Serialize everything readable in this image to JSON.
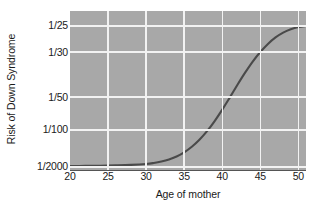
{
  "chart_data": {
    "type": "line",
    "title": "",
    "xlabel": "Age of mother",
    "ylabel": "Risk of Down Syndrome",
    "xlim": [
      20,
      51
    ],
    "grid": true,
    "legend": null,
    "xticks": [
      {
        "label": "20",
        "value": 20
      },
      {
        "label": "25",
        "value": 25
      },
      {
        "label": "30",
        "value": 30
      },
      {
        "label": "35",
        "value": 35
      },
      {
        "label": "40",
        "value": 40
      },
      {
        "label": "45",
        "value": 45
      },
      {
        "label": "50",
        "value": 50
      }
    ],
    "yticks": [
      {
        "label": "1/25",
        "value": 0.04,
        "pixel_frac": 0.094
      },
      {
        "label": "1/30",
        "value": 0.0333,
        "pixel_frac": 0.258
      },
      {
        "label": "1/50",
        "value": 0.02,
        "pixel_frac": 0.541
      },
      {
        "label": "1/100",
        "value": 0.01,
        "pixel_frac": 0.748
      },
      {
        "label": "1/2000",
        "value": 0.0005,
        "pixel_frac": 0.981
      }
    ],
    "series": [
      {
        "name": "Risk of Down Syndrome",
        "color": "#4a4a4a",
        "x": [
          20,
          22,
          24,
          26,
          28,
          30,
          31,
          32,
          33,
          34,
          35,
          36,
          37,
          38,
          39,
          40,
          41,
          42,
          43,
          44,
          45,
          46,
          47,
          48,
          49,
          50,
          51
        ],
        "y_labels": [
          "1/1800",
          "1/1790",
          "1/1770",
          "1/1740",
          "1/1700",
          "1/1640",
          "1/1580",
          "1/1500",
          "1/1380",
          "1/1230",
          "1/1050",
          "1/860",
          "1/690",
          "1/520",
          "1/380",
          "1/270",
          "1/190",
          "1/140",
          "1/100",
          "1/75",
          "1/58",
          "1/47",
          "1/39",
          "1/33",
          "1/29",
          "1/26",
          "1/25"
        ],
        "y_frac": [
          0.975,
          0.974,
          0.973,
          0.971,
          0.968,
          0.962,
          0.956,
          0.947,
          0.934,
          0.915,
          0.889,
          0.854,
          0.81,
          0.756,
          0.692,
          0.62,
          0.543,
          0.464,
          0.388,
          0.318,
          0.258,
          0.207,
          0.166,
          0.136,
          0.115,
          0.101,
          0.094
        ]
      }
    ]
  },
  "axes": {
    "ylabel": "Risk of Down Syndrome",
    "xlabel": "Age of mother"
  },
  "colors": {
    "plot_background": "#a8a8a8",
    "gridline": "#f2f2f2",
    "curve": "#4a4a4a",
    "axis": "#555555",
    "text": "#1a1a1a",
    "page_background": "#ffffff"
  }
}
